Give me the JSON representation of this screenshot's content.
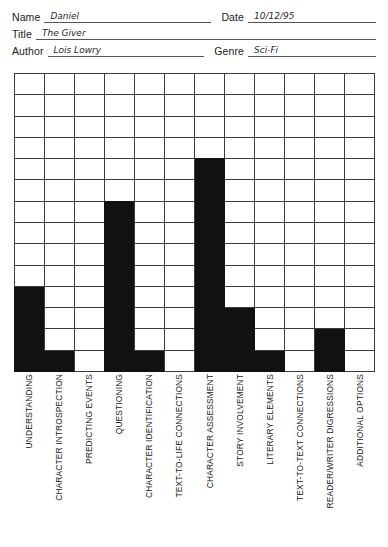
{
  "header": {
    "fields": [
      {
        "label": "Name",
        "value": "Daniel"
      },
      {
        "label": "Title",
        "value": "The Giver"
      },
      {
        "label": "Author",
        "value": "Lois Lowry"
      }
    ],
    "right_fields": [
      {
        "label": "Date",
        "value": "10/12/95"
      },
      {
        "label": "Genre",
        "value": "Sci-Fi"
      }
    ]
  },
  "chart_data": {
    "type": "bar",
    "title": "",
    "xlabel": "",
    "ylabel": "",
    "ylim": [
      0,
      14
    ],
    "grid": true,
    "grid_columns": 12,
    "grid_rows": 14,
    "legend": "none",
    "bar_color": "#111111",
    "grid_color": "#3c3c3c",
    "categories": [
      "UNDERSTANDING",
      "CHARACTER INTROSPECTION",
      "PREDICTING EVENTS",
      "QUESTIONING",
      "CHARACTER IDENTIFICATION",
      "TEXT-TO-LIFE CONNECTIONS",
      "CHARACTER ASSESSMENT",
      "STORY INVOLVEMENT",
      "LITERARY ELEMENTS",
      "TEXT-TO-TEXT CONNECTIONS",
      "READER/WRITER DIGRESSIONS",
      "ADDITIONAL OPTIONS"
    ],
    "values": [
      4,
      1,
      0,
      8,
      1,
      0,
      10,
      3,
      1,
      0,
      2,
      0
    ]
  }
}
